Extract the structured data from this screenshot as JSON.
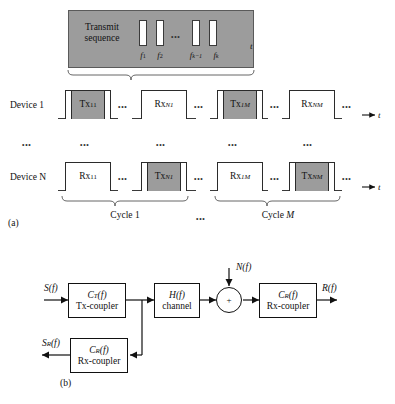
{
  "figure": {
    "panel_a": {
      "tag": "(a)",
      "transmit_sequence": {
        "title_line1": "Transmit",
        "title_line2": "sequence",
        "axis_label": "t",
        "pulses": 4,
        "frequency_labels": [
          "f1",
          "f2",
          "fk-1",
          "fk"
        ],
        "frequency_base": [
          "f",
          "f",
          "f",
          "f"
        ],
        "frequency_sub": [
          "1",
          "2",
          "k−1",
          "k"
        ],
        "ellipsis": "•••"
      },
      "rows": [
        {
          "label": "Device 1",
          "axis_label": "t",
          "slots": [
            {
              "type": "tx",
              "base": "Tx",
              "sub": "11"
            },
            {
              "type": "rx",
              "base": "Rx",
              "sub": "N1"
            },
            {
              "type": "tx",
              "base": "Tx",
              "sub": "1M"
            },
            {
              "type": "rx",
              "base": "Rx",
              "sub": "NM"
            }
          ]
        },
        {
          "label": "Device N",
          "axis_label": "t",
          "slots": [
            {
              "type": "rx",
              "base": "Rx",
              "sub": "11"
            },
            {
              "type": "tx",
              "base": "Tx",
              "sub": "N1"
            },
            {
              "type": "rx",
              "base": "Rx",
              "sub": "1M"
            },
            {
              "type": "tx",
              "base": "Tx",
              "sub": "NM"
            }
          ]
        }
      ],
      "vertical_ellipsis": "•••",
      "row_trailing_ellipsis": "•••",
      "inter_slot_ellipsis": "•••",
      "cycles": [
        {
          "base": "Cycle ",
          "index": "1"
        },
        {
          "base": "Cycle ",
          "index": "M"
        }
      ],
      "cycle_gap_ellipsis": "•••"
    },
    "panel_b": {
      "tag": "(b)",
      "blocks": [
        {
          "name": "tx-coupler",
          "transfer": "C_T(f)",
          "transfer_base": "C",
          "transfer_sub": "T",
          "transfer_tail": "(f)",
          "caption": "Tx-coupler"
        },
        {
          "name": "channel",
          "transfer": "H(f)",
          "transfer_base": "H",
          "transfer_sub": "",
          "transfer_tail": "(f)",
          "caption": "channel"
        },
        {
          "name": "rx-coupler-main",
          "transfer": "C_R(f)",
          "transfer_base": "C",
          "transfer_sub": "R",
          "transfer_tail": "(f)",
          "caption": "Rx-coupler"
        },
        {
          "name": "rx-coupler-feedback",
          "transfer": "C_R(f)",
          "transfer_base": "C",
          "transfer_sub": "R",
          "transfer_tail": "(f)",
          "caption": "Rx-coupler"
        }
      ],
      "signals": {
        "input": "S(f)",
        "input_base": "S",
        "input_tail": "(f)",
        "noise": "N(f)",
        "noise_base": "N",
        "noise_tail": "(f)",
        "output": "R(f)",
        "output_base": "R",
        "output_tail": "(f)",
        "reflected": "S_R(f)",
        "reflected_base": "S",
        "reflected_sub": "R",
        "reflected_tail": "(f)"
      },
      "summing_junction": "+"
    }
  }
}
